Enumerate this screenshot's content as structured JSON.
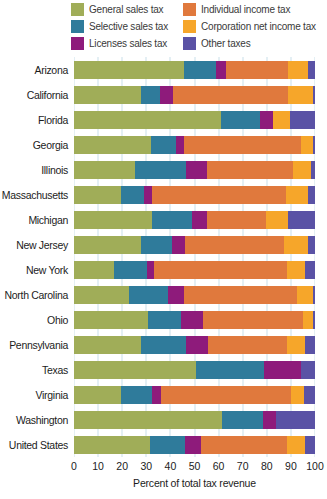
{
  "legend": {
    "items": [
      {
        "label": "General sales tax",
        "color": "#a0ad58"
      },
      {
        "label": "Selective sales tax",
        "color": "#2f7b9b"
      },
      {
        "label": "Licenses sales tax",
        "color": "#8e1b7b"
      },
      {
        "label": "Individual income tax",
        "color": "#e0793d"
      },
      {
        "label": "Corporation net income tax",
        "color": "#f6a62a"
      },
      {
        "label": "Other taxes",
        "color": "#5a52a5"
      }
    ]
  },
  "axis": {
    "tick_labels": [
      "0",
      "10",
      "20",
      "30",
      "40",
      "50",
      "60",
      "70",
      "80",
      "90",
      "100"
    ],
    "xlabel": "Percent of total tax revenue"
  },
  "chart_data": {
    "type": "bar",
    "stacked": true,
    "orientation": "horizontal",
    "title": "",
    "xlabel": "Percent of total tax revenue",
    "ylabel": "",
    "xlim": [
      0,
      100
    ],
    "grid": true,
    "gridline_color": "#c9dfe9",
    "legend_position": "top",
    "categories": [
      "Arizona",
      "California",
      "Florida",
      "Georgia",
      "Illinois",
      "Massachusetts",
      "Michigan",
      "New Jersey",
      "New York",
      "North Carolina",
      "Ohio",
      "Pennsylvania",
      "Texas",
      "Virginia",
      "Washington",
      "United States"
    ],
    "series": [
      {
        "name": "General sales tax",
        "color": "#a0ad58",
        "values": [
          45.5,
          28,
          61,
          32,
          25.5,
          19.5,
          32.5,
          28,
          16.5,
          23,
          30.5,
          28,
          50.5,
          19.5,
          61.5,
          31.5
        ]
      },
      {
        "name": "Selective sales tax",
        "color": "#2f7b9b",
        "values": [
          13.5,
          7.5,
          16,
          10.5,
          21,
          9.5,
          16.5,
          12.5,
          14,
          16,
          14,
          18.5,
          28.5,
          13,
          17,
          14.5
        ]
      },
      {
        "name": "Licenses sales tax",
        "color": "#8e1b7b",
        "values": [
          4,
          5.5,
          5.5,
          3,
          8.5,
          3.5,
          6,
          5.5,
          2.5,
          6.5,
          9,
          9,
          15,
          3.5,
          5.5,
          6.5
        ]
      },
      {
        "name": "Individual income tax",
        "color": "#e0793d",
        "values": [
          26,
          48,
          0,
          48.5,
          36,
          55.5,
          24.5,
          41,
          55.5,
          47,
          41.5,
          33,
          0,
          54,
          0,
          36
        ]
      },
      {
        "name": "Corporation net income tax",
        "color": "#f6a62a",
        "values": [
          8,
          10,
          7,
          5.3,
          7.5,
          9,
          9.5,
          10,
          7.5,
          6.5,
          4.3,
          7.5,
          0,
          5.5,
          0,
          7.5
        ]
      },
      {
        "name": "Other taxes",
        "color": "#5a52a5",
        "values": [
          3,
          1,
          10.5,
          0.7,
          1.5,
          3,
          11,
          3,
          4,
          1,
          0.7,
          4,
          6,
          4.5,
          16,
          4
        ]
      }
    ]
  }
}
